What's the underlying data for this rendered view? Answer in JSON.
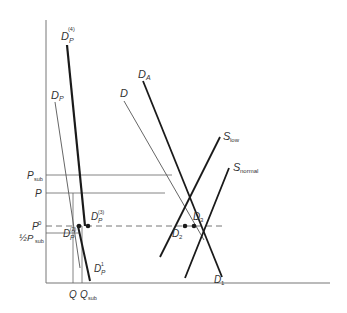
{
  "diagram": {
    "type": "supply-demand-economics",
    "axes": {
      "y_axis": {
        "x1": 46,
        "y1": 20,
        "x2": 46,
        "y2": 283
      },
      "x_axis": {
        "x1": 46,
        "y1": 283,
        "x2": 330,
        "y2": 283
      }
    },
    "price_levels": [
      {
        "id": "p_sub",
        "label": "P",
        "sub": "sub",
        "y": 175,
        "x_end": 172,
        "style": "solid"
      },
      {
        "id": "p",
        "label": "P",
        "sub": "",
        "y": 193,
        "x_end": 165,
        "style": "solid"
      },
      {
        "id": "p0",
        "label": "P",
        "sup": "0",
        "y": 226,
        "x_end": 222,
        "style": "dashed"
      },
      {
        "id": "half_p_sub",
        "label": "½P",
        "sub": "sub",
        "y": 233,
        "x_end": 80,
        "style": "solid"
      }
    ],
    "quantity_levels": [
      {
        "id": "q",
        "label": "Q",
        "sub": "",
        "x": 73
      },
      {
        "id": "q_sub",
        "label": "Q",
        "sub": "sub",
        "x": 82
      }
    ],
    "curves": [
      {
        "id": "dp4",
        "label": "D",
        "sub": "P",
        "sup": "(4)",
        "weight": "thick",
        "x1": 67,
        "y1": 45,
        "x2": 85,
        "y2": 226
      },
      {
        "id": "dp",
        "label": "D",
        "sub": "P",
        "sup": "",
        "weight": "thin",
        "x1": 55,
        "y1": 102,
        "x2": 80,
        "y2": 268
      },
      {
        "id": "dp1",
        "label": "D",
        "sub": "P",
        "sup": "1",
        "weight": "thick",
        "x1": 78,
        "y1": 226,
        "x2": 90,
        "y2": 281
      },
      {
        "id": "d",
        "label": "D",
        "sub": "",
        "sup": "",
        "weight": "thin",
        "x1": 124,
        "y1": 101,
        "x2": 204,
        "y2": 240
      },
      {
        "id": "da",
        "label": "D",
        "sub": "A",
        "sup": "",
        "weight": "thick",
        "x1": 143,
        "y1": 81,
        "x2": 222,
        "y2": 277
      },
      {
        "id": "s_low",
        "label": "S",
        "sub": "low",
        "weight": "thick",
        "x1": 160,
        "y1": 257,
        "x2": 220,
        "y2": 137
      },
      {
        "id": "s_normal",
        "label": "S",
        "sub": "normal",
        "weight": "thick",
        "x1": 185,
        "y1": 278,
        "x2": 229,
        "y2": 168
      }
    ],
    "points": [
      {
        "id": "dp2",
        "label": "D",
        "sub": "P",
        "sup": "(2)",
        "x": 79,
        "y": 226
      },
      {
        "id": "dp3",
        "label": "D",
        "sub": "P",
        "sup": "(3)",
        "x": 88,
        "y": 226
      },
      {
        "id": "d2",
        "label": "D",
        "sub": "2",
        "x": 185,
        "y": 226
      },
      {
        "id": "d3",
        "label": "D",
        "sub": "3",
        "x": 194,
        "y": 226
      }
    ],
    "labels": {
      "dp4": {
        "main": "D",
        "sub": "P",
        "sup": "(4)"
      },
      "dp": {
        "main": "D",
        "sub": "P"
      },
      "dp1": {
        "main": "D",
        "sub": "P",
        "sup": "1"
      },
      "dp2": {
        "main": "D",
        "sub": "P",
        "sup": "(2)"
      },
      "dp3": {
        "main": "D",
        "sub": "P",
        "sup": "(3)"
      },
      "d": {
        "main": "D"
      },
      "da": {
        "main": "D",
        "sub": "A"
      },
      "d1": {
        "main": "D",
        "sub": "1"
      },
      "d2": {
        "main": "D",
        "sub": "2"
      },
      "d3": {
        "main": "D",
        "sub": "3"
      },
      "s_low": {
        "main": "S",
        "sub": "low"
      },
      "s_normal": {
        "main": "S",
        "sub": "normal"
      },
      "p_sub": {
        "main": "P",
        "sub": "sub"
      },
      "p": {
        "main": "P"
      },
      "p0": {
        "main": "P",
        "sup": "0"
      },
      "half_p_sub": {
        "main": "½P",
        "sub": "sub"
      },
      "q": {
        "main": "Q"
      },
      "q_sub": {
        "main": "Q",
        "sub": "sub"
      }
    },
    "colors": {
      "line": "#1a1a1a",
      "thin_line": "#555555",
      "axis": "#777777",
      "text": "#333333",
      "background": "#ffffff"
    }
  }
}
